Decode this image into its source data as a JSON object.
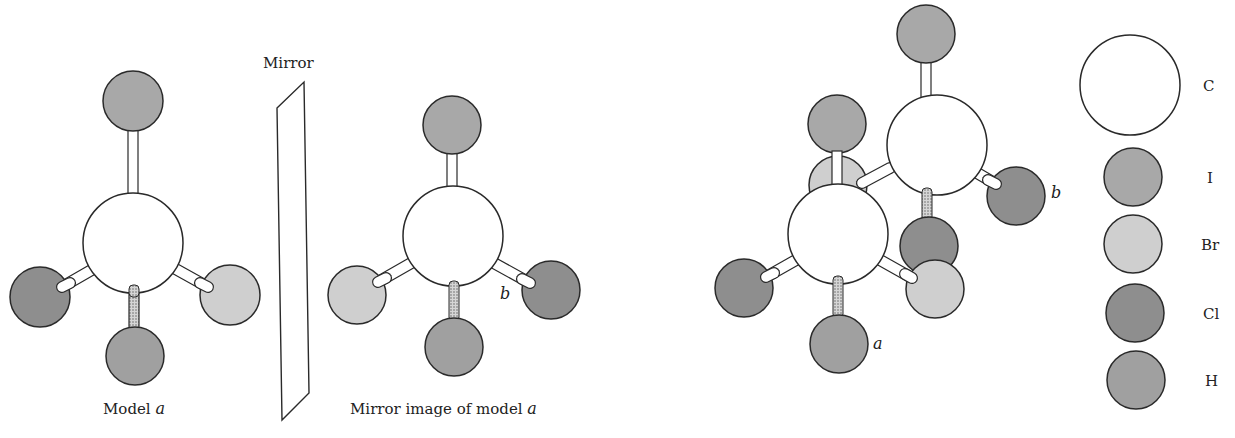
{
  "figure": {
    "mirror_label": "Mirror",
    "model_a_caption_prefix": "Model ",
    "model_a_caption_var": "a",
    "mirror_image_caption_prefix": "Mirror image of model ",
    "mirror_image_caption_var": "a",
    "mirror_image_marker": "b",
    "composite_marker_a": "a",
    "composite_marker_b": "b"
  },
  "legend": {
    "items": [
      {
        "symbol": "C",
        "fill": "#ffffff"
      },
      {
        "symbol": "I",
        "fill": "#a8a8a8"
      },
      {
        "symbol": "Br",
        "fill": "#cfcfcf"
      },
      {
        "symbol": "Cl",
        "fill": "#8e8e8e"
      },
      {
        "symbol": "H",
        "fill": "#a0a0a0"
      }
    ]
  },
  "colors": {
    "stroke": "#2a2a2a",
    "carbon": "#ffffff",
    "iodine": "#a8a8a8",
    "bromine": "#cfcfcf",
    "chlorine": "#8e8e8e",
    "hydrogen": "#a0a0a0",
    "stipple_bond": "#c4c4c4"
  }
}
